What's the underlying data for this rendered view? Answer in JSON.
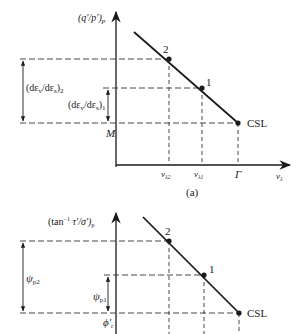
{
  "figure": {
    "panel_a": {
      "caption": "(a)",
      "y_axis_label": "(q′/p′)",
      "y_axis_label_sub": "p",
      "x_axis_label": "v",
      "x_axis_label_sub": "λ",
      "y_tick_label": "M",
      "x_ticks": [
        {
          "label": "v",
          "sub": "λ2"
        },
        {
          "label": "v",
          "sub": "λ1"
        },
        {
          "label": "Γ",
          "sub": ""
        }
      ],
      "points": [
        {
          "label": "2"
        },
        {
          "label": "1"
        },
        {
          "label": "CSL"
        }
      ],
      "dimension_2": {
        "label": "(dε",
        "sub_v": "v",
        "mid": "/dε",
        "sub_s": "s",
        "close": ")",
        "sub": "2"
      },
      "dimension_1": {
        "label": "(dε",
        "sub_v": "v",
        "mid": "/dε",
        "sub_s": "s",
        "close": ")",
        "sub": "1"
      }
    },
    "panel_b": {
      "y_axis_label": "(tan",
      "y_axis_label_sup": "−1",
      "y_axis_label_rest": " τ′/σ′)",
      "y_axis_label_sub": "p",
      "y_tick_label": "ϕ′",
      "y_tick_label_sub": "c",
      "points": [
        {
          "label": "2"
        },
        {
          "label": "1"
        },
        {
          "label": "CSL"
        }
      ],
      "dimension_2": {
        "label": "ψ",
        "sub": "p2"
      },
      "dimension_1": {
        "label": "ψ",
        "sub": "p1"
      }
    }
  }
}
